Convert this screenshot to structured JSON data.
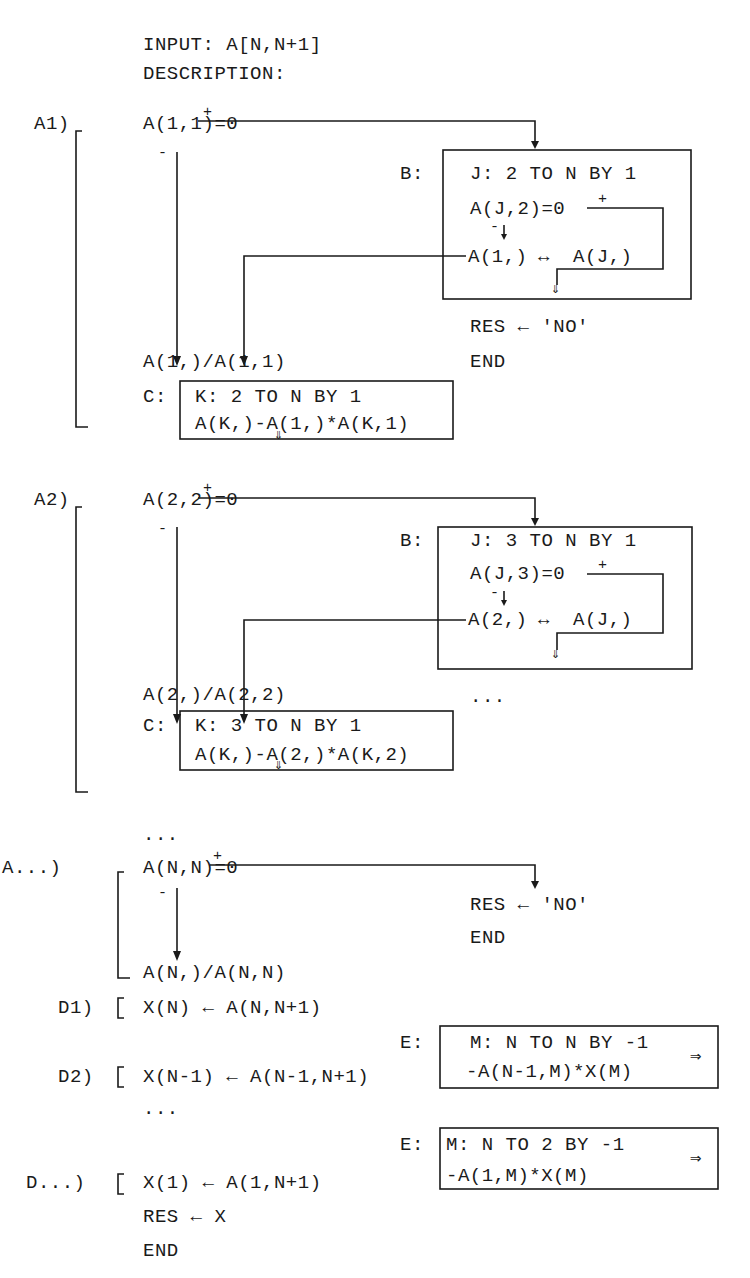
{
  "header": {
    "input": "INPUT: A[N,N+1]",
    "description": "DESCRIPTION:"
  },
  "A1": {
    "label": "A1)",
    "cond": "A(1,1)=0",
    "plus": "+",
    "minus": "-",
    "B": {
      "label": "B:",
      "loop": "J: 2 TO N BY 1",
      "cond": "A(J,2)=0",
      "swap_left": "A(1,)",
      "swap_arrow": "↔",
      "swap_right": "A(J,)",
      "plus": "+",
      "minus": "-"
    },
    "fail": {
      "res": "RES ← 'NO'",
      "end": "END"
    },
    "divide": "A(1,)/A(1,1)",
    "C": {
      "label": "C:",
      "loop": "K: 2 TO N BY 1",
      "expr": "A(K,)-A(1,)*A(K,1)"
    }
  },
  "A2": {
    "label": "A2)",
    "cond": "A(2,2)=0",
    "plus": "+",
    "minus": "-",
    "B": {
      "label": "B:",
      "loop": "J: 3 TO N BY 1",
      "cond": "A(J,3)=0",
      "swap_left": "A(2,)",
      "swap_arrow": "↔",
      "swap_right": "A(J,)",
      "plus": "+",
      "minus": "-"
    },
    "fail": {
      "ellipsis": "..."
    },
    "divide": "A(2,)/A(2,2)",
    "C": {
      "label": "C:",
      "loop": "K: 3 TO N BY 1",
      "expr": "A(K,)-A(2,)*A(K,2)"
    }
  },
  "ellipsis_mid": "...",
  "An": {
    "label": "A...)",
    "cond": "A(N,N)=0",
    "plus": "+",
    "minus": "-",
    "fail": {
      "res": "RES ← 'NO'",
      "end": "END"
    },
    "divide": "A(N,)/A(N,N)"
  },
  "D1": {
    "label": "D1)",
    "expr": "X(N) ← A(N,N+1)"
  },
  "D2": {
    "label": "D2)",
    "expr": "X(N-1) ← A(N-1,N+1)",
    "E": {
      "label": "E:",
      "loop": "M: N TO N BY -1",
      "expr": "-A(N-1,M)*X(M)",
      "arrow": "⇒"
    }
  },
  "ellipsis_d": "...",
  "Dn": {
    "label": "D...)",
    "expr": "X(1) ← A(1,N+1)",
    "res": "RES ← X",
    "end": "END",
    "E": {
      "label": "E:",
      "loop": "M: N TO 2 BY -1",
      "expr": "-A(1,M)*X(M)",
      "arrow": "⇒"
    }
  },
  "glyphs": {
    "down_double_arrow": "⇓"
  }
}
